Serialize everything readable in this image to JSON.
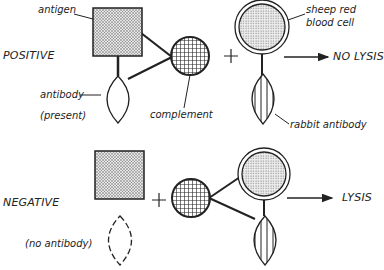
{
  "positive": {
    "title": "POSITIVE",
    "antigen_label": "antigen",
    "antibody_label": "antibody",
    "antibody_note": "(present)",
    "complement_label": "complement",
    "plus": "+",
    "rbc_label_line1": "sheep red",
    "rbc_label_line2": "blood cell",
    "rabbit_antibody_label": "rabbit antibody",
    "result": "NO LYSIS"
  },
  "negative": {
    "title": "NEGATIVE",
    "antibody_note": "(no antibody)",
    "plus": "+",
    "result": "LYSIS"
  },
  "colors": {
    "ink": "#222222",
    "background": "#ffffff"
  }
}
